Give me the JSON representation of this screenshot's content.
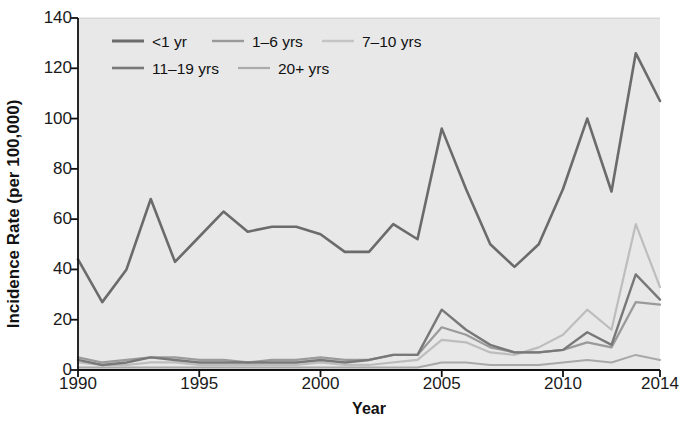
{
  "chart_data": {
    "type": "line",
    "title": "",
    "xlabel": "Year",
    "ylabel": "Incidence Rate (per 100,000)",
    "xlim": [
      1990,
      2014
    ],
    "ylim": [
      0,
      140
    ],
    "yticks": [
      0,
      20,
      40,
      60,
      80,
      100,
      120,
      140
    ],
    "xticks": [
      1990,
      1995,
      2000,
      2005,
      2010,
      2014
    ],
    "grid": false,
    "legend_position": "top-left-inside",
    "plot_background": "#e8e8e8",
    "x": [
      1990,
      1991,
      1992,
      1993,
      1994,
      1995,
      1996,
      1997,
      1998,
      1999,
      2000,
      2001,
      2002,
      2003,
      2004,
      2005,
      2006,
      2007,
      2008,
      2009,
      2010,
      2011,
      2012,
      2013,
      2014
    ],
    "series": [
      {
        "name": "<1 yr",
        "color": "#6b6b6b",
        "width": 2.6,
        "values": [
          44,
          27,
          40,
          68,
          43,
          53,
          63,
          55,
          57,
          57,
          54,
          47,
          47,
          58,
          52,
          96,
          72,
          50,
          41,
          50,
          72,
          100,
          71,
          126,
          107
        ]
      },
      {
        "name": "1–6 yrs",
        "color": "#9a9a9a",
        "width": 2.2,
        "values": [
          5,
          3,
          4,
          5,
          5,
          4,
          4,
          3,
          4,
          4,
          5,
          4,
          4,
          6,
          6,
          17,
          14,
          9,
          7,
          7,
          8,
          11,
          9,
          27,
          26
        ]
      },
      {
        "name": "7–10 yrs",
        "color": "#bdbdbd",
        "width": 2.2,
        "values": [
          3,
          2,
          2,
          3,
          3,
          2,
          2,
          2,
          2,
          2,
          3,
          2,
          2,
          3,
          4,
          12,
          11,
          7,
          6,
          9,
          14,
          24,
          16,
          58,
          33
        ]
      },
      {
        "name": "11–19 yrs",
        "color": "#787878",
        "width": 2.4,
        "values": [
          4,
          2,
          3,
          5,
          4,
          3,
          3,
          3,
          3,
          3,
          4,
          3,
          4,
          6,
          6,
          24,
          16,
          10,
          7,
          7,
          8,
          15,
          10,
          38,
          28
        ]
      },
      {
        "name": "20+ yrs",
        "color": "#a8a8a8",
        "width": 2.0,
        "values": [
          1,
          1,
          1,
          1,
          1,
          1,
          1,
          1,
          1,
          1,
          1,
          1,
          1,
          1,
          1,
          3,
          3,
          2,
          2,
          2,
          3,
          4,
          3,
          6,
          4
        ]
      }
    ],
    "legend_rows": [
      [
        {
          "label": "<1 yr",
          "color": "#6b6b6b",
          "width": 3.0
        },
        {
          "label": "1–6 yrs",
          "color": "#9a9a9a",
          "width": 2.4
        },
        {
          "label": "7–10 yrs",
          "color": "#c4c4c4",
          "width": 2.4
        }
      ],
      [
        {
          "label": "11–19 yrs",
          "color": "#787878",
          "width": 2.6
        },
        {
          "label": "20+ yrs",
          "color": "#ababab",
          "width": 2.2
        }
      ]
    ]
  },
  "axis": {
    "ytick_labels": [
      "140",
      "120",
      "100",
      "80",
      "60",
      "40",
      "20",
      "0"
    ],
    "xtick_labels": [
      "1990",
      "1995",
      "2000",
      "2005",
      "2010",
      "2014"
    ]
  }
}
